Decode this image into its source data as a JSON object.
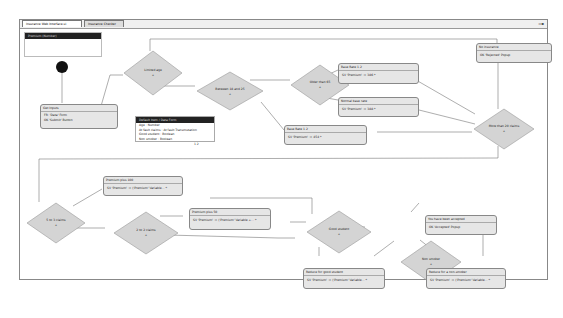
{
  "tabs": [
    {
      "label": "Insurance Web Interface.ui",
      "active": true
    },
    {
      "label": "Insurance Checker",
      "active": false
    }
  ],
  "dock_panel": {
    "title": "Premium (Number)"
  },
  "popup": {
    "title": "Default Item / Data Form",
    "rows": [
      "Age : Number",
      "At fault claims : At fault Transmutation",
      "Good student : Boolean",
      "Non smoker : Boolean"
    ],
    "footer": "1 2"
  },
  "nodes": {
    "get_inputs": {
      "title": "Get Inputs",
      "rows": [
        "FR: 'Data' Form",
        "OK 'Submit' Button"
      ]
    },
    "base_rate_a": {
      "title": "Base Rate 1.2",
      "row": "SV 'Premium' := 386 *"
    },
    "normal_base_rate": {
      "title": "Normal base rate",
      "row": "SV 'Premium' := 388 *"
    },
    "base_rate_b": {
      "title": "Base Rate 1.2",
      "row": "SV 'Premium' := 454 *"
    },
    "no_insurance": {
      "title": "No insurance",
      "row": "OK 'Rejected' Popup"
    },
    "premium_plus_100": {
      "title": "Premium plus 100",
      "row": "SV 'Premium' := ('Premium' Variable... *"
    },
    "premium_plus_50": {
      "title": "Premium plus 50",
      "row": "SV 'Premium' := ('Premium' Variable +... *"
    },
    "reduce_good_student": {
      "title": "Reduce for good student",
      "row": "SV 'Premium' := ('Premium' Variable... *"
    },
    "accepted": {
      "title": "You have been accepted",
      "row": "OK 'Accepted' Popup"
    },
    "reduce_non_smoker": {
      "title": "Reduce for a non-smoker",
      "row": "SV 'Premium' := ('Premium' Variable... *"
    }
  },
  "decisions": {
    "limited_age": "Limited age",
    "between_18_25": "Between 18 and 25",
    "older_than_65": "Older than 65",
    "more_than_20_claims": "More than 20 claims",
    "five_claims": "5 to 3 claims",
    "two_claims": "2 to 2 claims",
    "good_student": "Good student",
    "non_smoker": "Non smoker"
  },
  "decision_marker": "+",
  "caption": "Figure — Insurance Checker flow"
}
